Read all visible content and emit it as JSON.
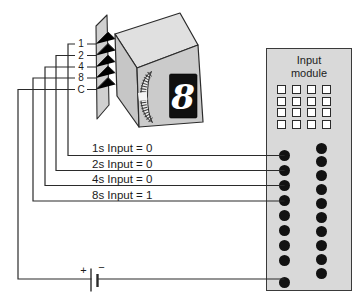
{
  "thumbwheel_switch": {
    "digit": "8",
    "wire_labels": [
      "1",
      "2",
      "4",
      "8",
      "C"
    ]
  },
  "annotations": {
    "input_1s": "1s Input = 0",
    "input_2s": "2s Input = 0",
    "input_4s": "4s Input = 0",
    "input_8s": "8s Input = 1"
  },
  "input_module": {
    "title_line1": "Input",
    "title_line2": "module",
    "led_count": 16,
    "terminals_left": 9,
    "terminals_right": 10
  },
  "battery": {
    "positive": "+",
    "negative": "−"
  },
  "colors": {
    "line": "#2b2b2b",
    "module_fill": "#d9d9d9",
    "box_front": "#cbcbcb",
    "box_top": "#e0e0e0",
    "box_side": "#c6c6c6",
    "plate": "#d0d0d0",
    "display_bg": "#101010",
    "display_digit": "#ffffff"
  }
}
